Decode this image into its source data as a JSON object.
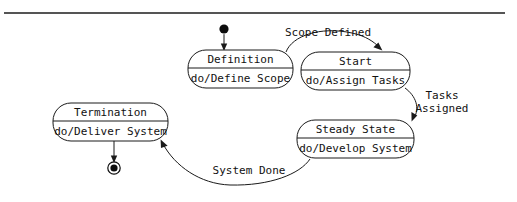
{
  "diagram": {
    "type": "uml-state-machine",
    "title": "",
    "canvas": {
      "width": 517,
      "height": 202,
      "background": "#ffffff"
    },
    "stroke_color": "#1a1a1a",
    "text_color": "#111111",
    "rule_color": "#555555",
    "states": [
      {
        "id": "definition",
        "name": "Definition",
        "activity": "do/Define Scope",
        "x": 188,
        "y": 50,
        "w": 105,
        "h": 38,
        "divider_y": 68
      },
      {
        "id": "start",
        "name": "Start",
        "activity": "do/Assign Tasks",
        "x": 301,
        "y": 52,
        "w": 109,
        "h": 38,
        "divider_y": 70
      },
      {
        "id": "steady-state",
        "name": "Steady State",
        "activity": "do/Develop System",
        "x": 297,
        "y": 120,
        "w": 117,
        "h": 38,
        "divider_y": 138
      },
      {
        "id": "termination",
        "name": "Termination",
        "activity": "do/Deliver System",
        "x": 53,
        "y": 103,
        "w": 115,
        "h": 38,
        "divider_y": 121
      }
    ],
    "pseudostates": [
      {
        "id": "initial",
        "kind": "initial",
        "cx": 224,
        "cy": 29,
        "r": 4.6
      },
      {
        "id": "final",
        "kind": "final",
        "cx": 114,
        "cy": 168,
        "r_outer": 6.2,
        "r_inner": 3.6
      }
    ],
    "transitions": [
      {
        "id": "t-initial",
        "from": "initial",
        "to": "definition",
        "label": ""
      },
      {
        "id": "t-scope-defined",
        "from": "definition",
        "to": "start",
        "label": "Scope Defined",
        "label_x": 328,
        "label_y": 33
      },
      {
        "id": "t-tasks-assigned",
        "from": "start",
        "to": "steady-state",
        "label": "Tasks Assigned",
        "label_line_1": "Tasks",
        "label_line_2": "Assigned",
        "label_x": 442,
        "label_y": 102
      },
      {
        "id": "t-system-done",
        "from": "steady-state",
        "to": "termination",
        "label": "System Done",
        "label_x": 249,
        "label_y": 171
      },
      {
        "id": "t-final",
        "from": "termination",
        "to": "final",
        "label": ""
      }
    ],
    "top_rule": {
      "x1": 4,
      "y1": 13,
      "x2": 505,
      "y2": 13
    }
  }
}
